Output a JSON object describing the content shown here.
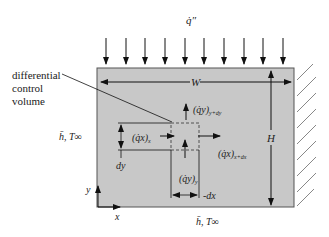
{
  "diagram": {
    "heat_flux_label": "q̇″",
    "width_label": "W",
    "height_label": "H",
    "callout": {
      "lines": [
        "differential",
        "control",
        "volume"
      ]
    },
    "left_boundary_label": "h̄, T∞",
    "bottom_boundary_label": "h̄, T∞",
    "dy_label": "dy",
    "dx_label": "dx",
    "axes": {
      "x_label": "x",
      "y_label": "y"
    },
    "fluxes": {
      "qx_in": {
        "main": "(q̇x)",
        "sub": "x"
      },
      "qx_out": {
        "main": "(q̇x)",
        "sub": "x+dx"
      },
      "qy_in": {
        "main": "(q̇y)",
        "sub": "y"
      },
      "qy_out": {
        "main": "(q̇y)",
        "sub": "y+dy"
      }
    },
    "colors": {
      "plate_fill": "#c8c8c8",
      "stroke": "#111111",
      "hatch": "#888888"
    }
  }
}
